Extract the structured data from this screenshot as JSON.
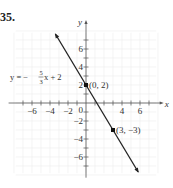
{
  "problem_number": "35.",
  "chart_data": {
    "type": "line",
    "title": "",
    "xlabel": "x",
    "ylabel": "y",
    "xlim": [
      -8,
      8
    ],
    "ylim": [
      -8,
      8
    ],
    "grid": true,
    "x_tick_labels": [
      {
        "value": -6,
        "label": "−6"
      },
      {
        "value": -4,
        "label": "−4"
      },
      {
        "value": -2,
        "label": "−2"
      },
      {
        "value": 4,
        "label": "4"
      },
      {
        "value": 6,
        "label": "6"
      }
    ],
    "y_tick_labels": [
      {
        "value": 6,
        "label": "6"
      },
      {
        "value": 4,
        "label": "4"
      },
      {
        "value": 2,
        "label": "2"
      },
      {
        "value": -2,
        "label": "−2"
      },
      {
        "value": -4,
        "label": "−4"
      },
      {
        "value": -6,
        "label": "−6"
      }
    ],
    "origin_label": "0",
    "series": [
      {
        "name": "y = −(5/3)x + 2",
        "slope": -1.6667,
        "intercept": 2,
        "x_range": [
          -3.4,
          5.8
        ],
        "arrows": "both",
        "color": "#222222"
      }
    ],
    "points": [
      {
        "x": 0,
        "y": 2,
        "label": "(0, 2)"
      },
      {
        "x": 3,
        "y": -3,
        "label": "(3, −3)"
      }
    ],
    "annotations": [
      {
        "text_pre": "y = −",
        "frac_num": "5",
        "frac_den": "3",
        "text_post": "x + 2",
        "anchor_x": -8.0,
        "anchor_y": 3.0
      }
    ]
  }
}
